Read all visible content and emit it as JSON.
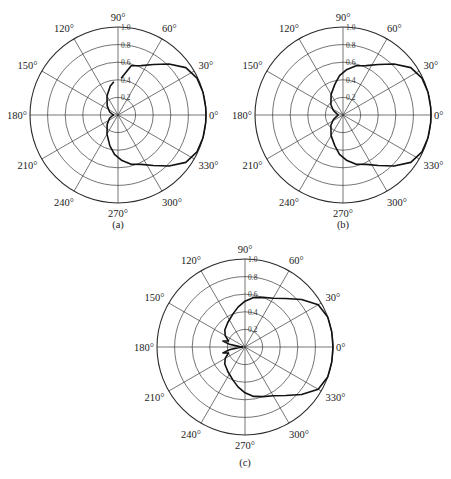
{
  "chart_data": [
    {
      "id": "a",
      "type": "polar-line",
      "caption": "(a)",
      "center": [
        118,
        115
      ],
      "radius": 88,
      "caption_y": 228,
      "r_ticks": [
        "0.2",
        "0.4",
        "0.6",
        "0.8",
        "1.0"
      ],
      "r_range": [
        0,
        1.0
      ],
      "angle_ticks": [
        "0°",
        "30°",
        "60°",
        "90°",
        "120°",
        "150°",
        "180°",
        "210°",
        "240°",
        "270°",
        "300°",
        "330°"
      ],
      "grid": true,
      "series": [
        {
          "name": "pattern-a",
          "theta_deg": [
            85,
            75,
            65,
            55,
            45,
            35,
            25,
            15,
            5,
            0,
            -5,
            -15,
            -25,
            -35,
            -45,
            -55,
            -65,
            -75,
            -85,
            -95,
            -105,
            -120,
            -140,
            -160,
            -175,
            180,
            175,
            160,
            140,
            120,
            105,
            97
          ],
          "r": [
            0.42,
            0.58,
            0.62,
            0.7,
            0.82,
            0.94,
            0.99,
            1.0,
            1.0,
            1.0,
            1.0,
            1.0,
            0.99,
            0.94,
            0.82,
            0.7,
            0.62,
            0.58,
            0.52,
            0.45,
            0.36,
            0.25,
            0.16,
            0.1,
            0.06,
            0.05,
            0.06,
            0.1,
            0.16,
            0.25,
            0.34,
            0.38
          ]
        }
      ]
    },
    {
      "id": "b",
      "type": "polar-line",
      "caption": "(b)",
      "center": [
        343,
        115
      ],
      "radius": 88,
      "caption_y": 228,
      "r_ticks": [
        "0.2",
        "0.4",
        "0.6",
        "0.8",
        "1.0"
      ],
      "r_range": [
        0,
        1.0
      ],
      "angle_ticks": [
        "0°",
        "30°",
        "60°",
        "90°",
        "120°",
        "150°",
        "180°",
        "210°",
        "240°",
        "270°",
        "300°",
        "330°"
      ],
      "grid": true,
      "series": [
        {
          "name": "pattern-b",
          "theta_deg": [
            -180,
            -170,
            -155,
            -140,
            -120,
            -105,
            -95,
            -85,
            -75,
            -65,
            -55,
            -45,
            -35,
            -25,
            -15,
            -5,
            0,
            5,
            15,
            25,
            35,
            45,
            55,
            65,
            75,
            85,
            95,
            105,
            120,
            140,
            155,
            170,
            180
          ],
          "r": [
            0.05,
            0.07,
            0.12,
            0.18,
            0.27,
            0.36,
            0.45,
            0.52,
            0.58,
            0.62,
            0.7,
            0.82,
            0.94,
            0.99,
            1.0,
            1.0,
            1.0,
            1.0,
            1.0,
            0.99,
            0.94,
            0.82,
            0.7,
            0.62,
            0.58,
            0.52,
            0.45,
            0.36,
            0.27,
            0.18,
            0.12,
            0.07,
            0.05
          ]
        }
      ]
    },
    {
      "id": "c",
      "type": "polar-line",
      "caption": "(c)",
      "center": [
        245,
        347
      ],
      "radius": 88,
      "caption_y": 466,
      "r_ticks": [
        "0.2",
        "0.4",
        "0.6",
        "0.8",
        "1.0"
      ],
      "r_range": [
        0,
        1.0
      ],
      "angle_ticks": [
        "0°",
        "30°",
        "60°",
        "90°",
        "120°",
        "150°",
        "180°",
        "210°",
        "240°",
        "270°",
        "300°",
        "330°"
      ],
      "grid": true,
      "series": [
        {
          "name": "pattern-c",
          "theta_deg": [
            -180,
            -176,
            -170,
            -165,
            -160,
            -150,
            -140,
            -125,
            -110,
            -100,
            -90,
            -80,
            -70,
            -60,
            -50,
            -40,
            -30,
            -20,
            -10,
            0,
            10,
            20,
            30,
            40,
            50,
            60,
            70,
            80,
            90,
            100,
            110,
            125,
            140,
            150,
            160,
            165,
            170,
            176,
            180
          ],
          "r": [
            0.02,
            0.06,
            0.18,
            0.26,
            0.2,
            0.26,
            0.3,
            0.34,
            0.4,
            0.46,
            0.52,
            0.57,
            0.6,
            0.64,
            0.72,
            0.84,
            0.96,
            1.0,
            1.0,
            1.0,
            1.0,
            1.0,
            0.96,
            0.84,
            0.72,
            0.64,
            0.6,
            0.57,
            0.52,
            0.46,
            0.4,
            0.34,
            0.3,
            0.26,
            0.2,
            0.26,
            0.18,
            0.06,
            0.02
          ]
        }
      ]
    }
  ]
}
